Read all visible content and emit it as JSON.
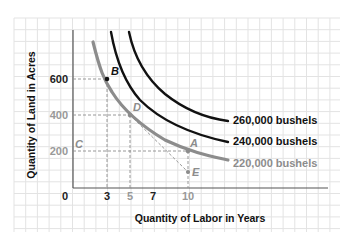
{
  "chart_data": {
    "type": "line",
    "title": "",
    "xlabel": "Quantity of Labor in Years",
    "ylabel": "Quantity of Land in Acres",
    "xlim": [
      0,
      22
    ],
    "ylim": [
      0,
      850
    ],
    "grid": true,
    "x_ticks": [
      "0",
      "3",
      "5",
      "7",
      "10"
    ],
    "y_ticks": [
      "600",
      "400",
      "200"
    ],
    "series": [
      {
        "name": "220,000 bushels",
        "color": "#8c8c8c",
        "label": "220,000 bushels",
        "points": [
          [
            1.8,
            860
          ],
          [
            3,
            600
          ],
          [
            5,
            400
          ],
          [
            7,
            290
          ],
          [
            10,
            200
          ],
          [
            14,
            140
          ],
          [
            19.5,
            105
          ]
        ]
      },
      {
        "name": "240,000 bushels",
        "color": "#111111",
        "label": "240,000 bushels",
        "points": [
          [
            3.4,
            860
          ],
          [
            5,
            620
          ],
          [
            7,
            460
          ],
          [
            10,
            340
          ],
          [
            14,
            265
          ],
          [
            19.5,
            225
          ]
        ]
      },
      {
        "name": "260,000 bushels",
        "color": "#111111",
        "label": "260,000 bushels",
        "points": [
          [
            8.2,
            860
          ],
          [
            10,
            700
          ],
          [
            13,
            520
          ],
          [
            16,
            425
          ],
          [
            19.5,
            365
          ]
        ]
      }
    ],
    "annotations": [
      {
        "label": "B",
        "x": 3,
        "y": 600,
        "on": "220,000 bushels"
      },
      {
        "label": "D",
        "x": 5,
        "y": 400,
        "on": "220,000 bushels"
      },
      {
        "label": "A",
        "x": 10,
        "y": 200,
        "on": "220,000 bushels"
      },
      {
        "label": "C",
        "x": 0,
        "y": 200
      },
      {
        "label": "E",
        "x": 10,
        "y": 90
      }
    ],
    "reference_lines": [
      {
        "type": "dashed",
        "from": [
          0,
          600
        ],
        "to": [
          3,
          600
        ]
      },
      {
        "type": "dashed",
        "from": [
          3,
          600
        ],
        "to": [
          3,
          0
        ]
      },
      {
        "type": "dashed",
        "from": [
          0,
          400
        ],
        "to": [
          5,
          400
        ]
      },
      {
        "type": "dashed",
        "from": [
          5,
          400
        ],
        "to": [
          5,
          0
        ]
      },
      {
        "type": "dashed",
        "from": [
          0,
          200
        ],
        "to": [
          10,
          200
        ]
      },
      {
        "type": "dashed",
        "from": [
          10,
          200
        ],
        "to": [
          10,
          0
        ]
      },
      {
        "type": "dashed",
        "from": [
          5,
          400
        ],
        "to": [
          10,
          90
        ]
      }
    ]
  },
  "labels": {
    "xlabel": "Quantity of Labor in Years",
    "ylabel": "Quantity of Land in Acres",
    "origin": "0",
    "x_ticks": {
      "t3": "3",
      "t5": "5",
      "t7": "7",
      "t10": "10"
    },
    "y_ticks": {
      "t600": "600",
      "t400": "400",
      "t200": "200"
    },
    "curves": {
      "c260": "260,000 bushels",
      "c240": "240,000 bushels",
      "c220": "220,000 bushels"
    },
    "points": {
      "B": "B",
      "D": "D",
      "A": "A",
      "C": "C",
      "E": "E"
    }
  },
  "colors": {
    "grid": "#e3e3e3",
    "axis": "#555555",
    "dark_curve": "#111111",
    "light_curve": "#8c8c8c",
    "dashed": "#8c8c8c"
  }
}
